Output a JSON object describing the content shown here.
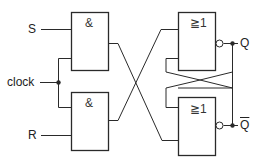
{
  "diagram": {
    "type": "clocked RS flip-flop logic diagram",
    "inputs": {
      "s": "S",
      "clock": "clock",
      "r": "R"
    },
    "outputs": {
      "q": "Q",
      "q_bar": "Q"
    },
    "gates": {
      "and_top": "&",
      "and_bottom": "&",
      "nor_top": "≧1",
      "nor_bottom": "≧1"
    },
    "colors": {
      "line": "#2a2a2a",
      "background": "#ffffff"
    }
  }
}
